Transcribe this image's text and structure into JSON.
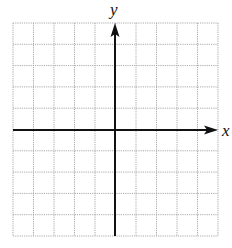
{
  "diagram": {
    "type": "coordinate-grid",
    "grid": {
      "columns": 10,
      "rows": 10,
      "left": 13,
      "top": 23,
      "right": 218,
      "bottom": 236,
      "line_color": "#aaaaaa",
      "line_style": "dotted"
    },
    "axes": {
      "color": "#111111",
      "x_axis": {
        "label": "x",
        "y_position": 130,
        "arrow": "right"
      },
      "y_axis": {
        "label": "y",
        "x_position": 115,
        "arrow": "up"
      }
    }
  }
}
